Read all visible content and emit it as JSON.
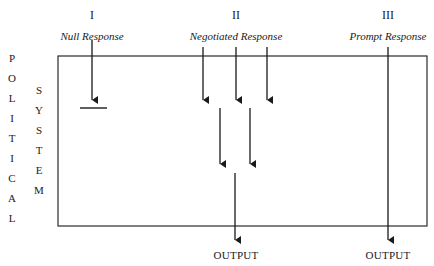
{
  "columns": [
    {
      "numeral": "I",
      "label": "Null Response"
    },
    {
      "numeral": "II",
      "label": "Negotiated Response"
    },
    {
      "numeral": "III",
      "label": "Prompt Response"
    }
  ],
  "left_labels": {
    "political": [
      "P",
      "O",
      "L",
      "I",
      "T",
      "I",
      "C",
      "A",
      "L"
    ],
    "system": [
      "S",
      "Y",
      "S",
      "T",
      "E",
      "M"
    ]
  },
  "outputs": [
    "OUTPUT",
    "OUTPUT"
  ]
}
